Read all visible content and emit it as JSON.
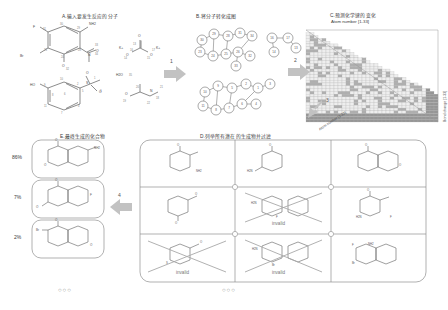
{
  "figure": {
    "caption_lang": "zh",
    "panels": {
      "A": {
        "id": "A",
        "title": "A.输入要发生反应的分子"
      },
      "B": {
        "id": "B",
        "title": "B.将分子转化成图"
      },
      "C": {
        "id": "C",
        "title": "C.预测化学键的变化",
        "subtitle": "Atom number [1-33]",
        "axis_right": "Bond change [1-33]",
        "axis_bottom": "Atom number [1-33]"
      },
      "D": {
        "id": "D",
        "title": "D.列举所有潜在的生成物并过滤"
      },
      "E": {
        "id": "E",
        "title": "E.最终生成的化合物"
      }
    },
    "arrows": [
      {
        "id": "1",
        "label": "1",
        "direction": "right"
      },
      {
        "id": "2",
        "label": "2",
        "direction": "right"
      },
      {
        "id": "3",
        "label": "3",
        "direction": "down-left"
      },
      {
        "id": "4",
        "label": "4",
        "direction": "left"
      }
    ],
    "panelA": {
      "reagents": [
        {
          "name": "nitro-aniline-bromo-fluoro",
          "atoms": [
            "F",
            "Br",
            "NH2",
            "N",
            "O",
            "O"
          ]
        },
        {
          "name": "potassium-carbonate",
          "atoms": [
            "K+",
            "K+",
            "O",
            "O",
            "O"
          ]
        },
        {
          "name": "water",
          "formula": "H2O",
          "index": "35"
        },
        {
          "name": "hydroxy-phenyl-methylsulfone",
          "atoms": [
            "HO",
            "S",
            "O",
            "O"
          ]
        },
        {
          "name": "dimethylformamide",
          "atoms": [
            "O",
            "N"
          ]
        }
      ],
      "atom_indices": [
        "1",
        "2",
        "3",
        "4",
        "5",
        "6",
        "7",
        "8",
        "9",
        "10",
        "11",
        "12",
        "13",
        "14",
        "15",
        "16",
        "17",
        "18",
        "19",
        "20",
        "21",
        "22",
        "23",
        "24",
        "25",
        "26",
        "27",
        "28",
        "29",
        "30",
        "31",
        "32",
        "33",
        "34",
        "35"
      ]
    },
    "panelB": {
      "graph_top": {
        "nodes": [
          "23",
          "24",
          "25",
          "26",
          "27",
          "28",
          "29",
          "30",
          "31",
          "32",
          "34",
          "33"
        ]
      },
      "graph_right": {
        "nodes": [
          "16",
          "17",
          "14",
          "15",
          "13"
        ]
      },
      "graph_bottom": {
        "nodes": [
          "1",
          "2",
          "3",
          "4",
          "5",
          "6",
          "7",
          "8",
          "9",
          "10",
          "11",
          "12"
        ]
      },
      "extra_nodes": [
        "18",
        "19",
        "20",
        "21",
        "22"
      ]
    },
    "panelC": {
      "matrix": {
        "rows": 33,
        "cols": 33,
        "shape": "lower-triangular",
        "colormap": "grayscale"
      },
      "axis_bottom_label": "Atom number [1-33]",
      "axis_right_label": "Bond change [1-33]"
    },
    "panelD": {
      "grid_rows": 3,
      "grid_cols": 3,
      "candidates": [
        {
          "cell": "r1c1",
          "invalid": false,
          "label": ""
        },
        {
          "cell": "r1c2",
          "invalid": false,
          "label": ""
        },
        {
          "cell": "r1c3",
          "invalid": false,
          "label": ""
        },
        {
          "cell": "r2c1",
          "invalid": false,
          "label": ""
        },
        {
          "cell": "r2c2",
          "invalid": true,
          "label": "invalid"
        },
        {
          "cell": "r2c3",
          "invalid": false,
          "label": ""
        },
        {
          "cell": "r3c1",
          "invalid": true,
          "label": "invalid"
        },
        {
          "cell": "r3c2",
          "invalid": true,
          "label": "invalid"
        },
        {
          "cell": "r3c3",
          "invalid": false,
          "label": ""
        }
      ],
      "ellipsis": "○○○"
    },
    "panelE": {
      "products": [
        {
          "rank": 1,
          "yield": "86%"
        },
        {
          "rank": 2,
          "yield": "7%"
        },
        {
          "rank": 3,
          "yield": "2%"
        }
      ],
      "ellipsis": "○○○"
    },
    "colors": {
      "ink": "#3a3a3a",
      "line": "#6e6e6e",
      "arrow": "#b8b8b8",
      "box": "#9a9a9a",
      "strike": "#9a9a9a",
      "matrix_light": "#f2f2f2",
      "matrix_dark": "#8e8e8e"
    }
  }
}
